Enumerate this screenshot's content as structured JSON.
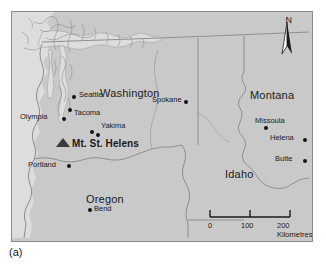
{
  "figure": {
    "caption": "(a)",
    "frame_border_color": "#8a8a8a",
    "land_color": "#c9c9c9",
    "water_color": "#dddddd",
    "border_line_color": "#8f8f8f",
    "text_color": "#1a1a1a"
  },
  "compass": {
    "letter": "N",
    "icon": "north-arrow-icon"
  },
  "scale": {
    "ticks": [
      "0",
      "100",
      "200 Kilometres"
    ],
    "unit": "Kilometres",
    "max_value": 200
  },
  "states": [
    {
      "name": "Washington",
      "x": 88,
      "y": 76
    },
    {
      "name": "Oregon",
      "x": 74,
      "y": 182
    },
    {
      "name": "Idaho",
      "x": 213,
      "y": 157
    },
    {
      "name": "Montana",
      "x": 252,
      "y": 78
    }
  ],
  "cities": [
    {
      "name": "Seattle",
      "label_x": 67,
      "label_y": 76,
      "dot_x": 60,
      "dot_y": 83,
      "align": "left"
    },
    {
      "name": "Tacoma",
      "label_x": 62,
      "label_y": 101,
      "dot_x": 56,
      "dot_y": 96,
      "align": "left"
    },
    {
      "name": "Olympia",
      "label_x": 10,
      "label_y": 105,
      "dot_x": 50,
      "dot_y": 105,
      "align": "left"
    },
    {
      "name": "Yakima",
      "label_x": 89,
      "label_y": 113,
      "dot_x": 84,
      "dot_y": 121,
      "align": "left"
    },
    {
      "name": "Spokane",
      "label_x": 140,
      "label_y": 77,
      "dot_x": 172,
      "dot_y": 88,
      "align": "left"
    },
    {
      "name": "Portland",
      "label_x": 16,
      "label_y": 155,
      "dot_x": 55,
      "dot_y": 152,
      "align": "left"
    },
    {
      "name": "Bend",
      "label_x": 82,
      "label_y": 203,
      "dot_x": 76,
      "dot_y": 202,
      "align": "left"
    },
    {
      "name": "Missoula",
      "label_x": 248,
      "label_y": 105,
      "dot_x": 252,
      "dot_y": 114,
      "align": "left"
    },
    {
      "name": "Helena",
      "label_x": 264,
      "label_y": 128,
      "dot_x": 291,
      "dot_y": 126,
      "align": "left"
    },
    {
      "name": "Butte",
      "label_x": 266,
      "label_y": 149,
      "dot_x": 291,
      "dot_y": 147,
      "align": "left"
    }
  ],
  "volcano": {
    "name": "Mt. St. Helens",
    "label_x": 62,
    "label_y": 131,
    "marker_x": 48,
    "marker_y": 131,
    "summit_dot_x": 78,
    "summit_dot_y": 124,
    "marker_icon": "volcano-triangle-icon"
  }
}
